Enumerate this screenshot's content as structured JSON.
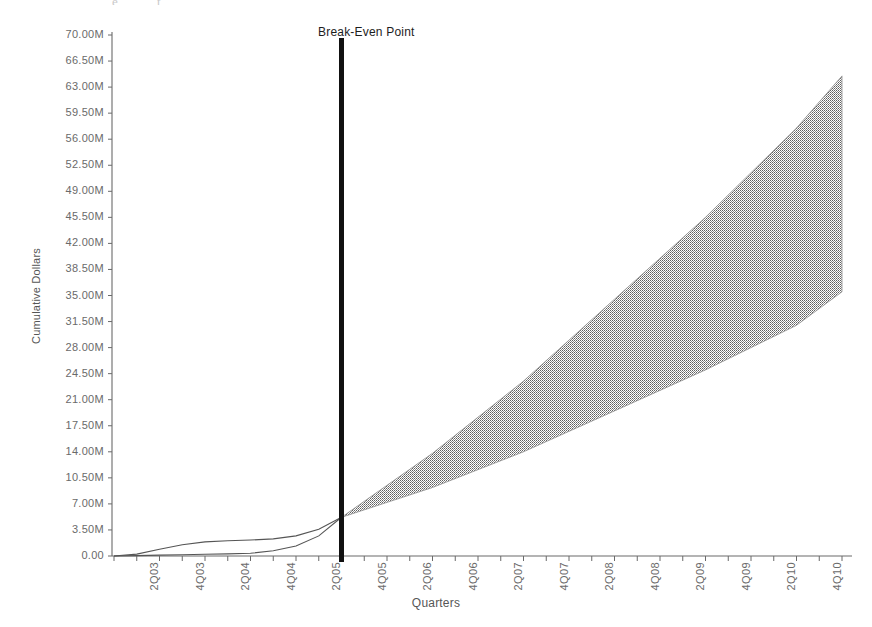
{
  "chart_data": {
    "type": "area",
    "title": "",
    "subtitle": "",
    "xlabel": "Quarters",
    "ylabel": "Cumulative Dollars",
    "grid": false,
    "legend_position": "none",
    "ylim": [
      0,
      70000000
    ],
    "y_ticks": [
      "0.00",
      "3.50M",
      "7.00M",
      "10.50M",
      "14.00M",
      "17.50M",
      "21.00M",
      "24.50M",
      "28.00M",
      "31.50M",
      "35.00M",
      "38.50M",
      "42.00M",
      "45.50M",
      "49.00M",
      "52.50M",
      "56.00M",
      "59.50M",
      "63.00M",
      "66.50M",
      "70.00M"
    ],
    "y_tick_values": [
      0,
      3500000,
      7000000,
      10500000,
      14000000,
      17500000,
      21000000,
      24500000,
      28000000,
      31500000,
      35000000,
      38500000,
      42000000,
      45500000,
      49000000,
      52500000,
      56000000,
      59500000,
      63000000,
      66500000,
      70000000
    ],
    "x_tick_labels": [
      "2Q03",
      "4Q03",
      "2Q04",
      "4Q04",
      "2Q05",
      "4Q05",
      "2Q06",
      "4Q06",
      "2Q07",
      "4Q07",
      "2Q08",
      "4Q08",
      "2Q09",
      "4Q09",
      "2Q10",
      "4Q10",
      "2Q11"
    ],
    "x_categories": [
      "2Q03",
      "3Q03",
      "4Q03",
      "1Q04",
      "2Q04",
      "3Q04",
      "4Q04",
      "1Q05",
      "2Q05",
      "3Q05",
      "4Q05",
      "1Q06",
      "2Q06",
      "3Q06",
      "4Q06",
      "1Q07",
      "2Q07",
      "3Q07",
      "4Q07",
      "1Q08",
      "2Q08",
      "3Q08",
      "4Q08",
      "1Q09",
      "2Q09",
      "3Q09",
      "4Q09",
      "1Q10",
      "2Q10",
      "3Q10",
      "4Q10",
      "1Q11",
      "2Q11"
    ],
    "annotations": [
      {
        "text": "Break-Even Point",
        "at_x": "4Q05",
        "type": "vertical-line",
        "color": "#111111"
      }
    ],
    "series": [
      {
        "name": "Historical Upper",
        "type": "line",
        "color": "#555555",
        "x": [
          "2Q03",
          "3Q03",
          "4Q03",
          "1Q04",
          "2Q04",
          "3Q04",
          "4Q04",
          "1Q05",
          "2Q05",
          "3Q05",
          "4Q05"
        ],
        "values": [
          0,
          250000,
          900000,
          1500000,
          1900000,
          2050000,
          2150000,
          2300000,
          2700000,
          3600000,
          5200000
        ]
      },
      {
        "name": "Historical Lower",
        "type": "line",
        "color": "#555555",
        "x": [
          "2Q03",
          "3Q03",
          "4Q03",
          "1Q04",
          "2Q04",
          "3Q04",
          "4Q04",
          "1Q05",
          "2Q05",
          "3Q05",
          "4Q05"
        ],
        "values": [
          0,
          60000,
          120000,
          180000,
          230000,
          280000,
          360000,
          700000,
          1350000,
          2700000,
          5200000
        ]
      },
      {
        "name": "Forecast Upper Bound",
        "type": "area-bound",
        "color": "#9a9a9a",
        "x": [
          "4Q05",
          "4Q06",
          "4Q07",
          "4Q08",
          "4Q09",
          "4Q10",
          "2Q11"
        ],
        "values": [
          5200000,
          13800000,
          23500000,
          34500000,
          45500000,
          57500000,
          64500000
        ]
      },
      {
        "name": "Forecast Lower Bound",
        "type": "area-bound",
        "color": "#9a9a9a",
        "x": [
          "4Q05",
          "4Q06",
          "4Q07",
          "4Q08",
          "4Q09",
          "4Q10",
          "2Q11"
        ],
        "values": [
          5200000,
          9200000,
          14000000,
          19500000,
          25000000,
          31000000,
          35500000
        ]
      }
    ],
    "fill_color": "#9b9b9b",
    "axis_color": "#6a6a6a"
  },
  "axes": {
    "y_title": "Cumulative Dollars",
    "x_title": "Quarters"
  },
  "annotation": {
    "break_even_label": "Break-Even Point"
  },
  "artifacts": {
    "top_left_smudge": "e",
    "top_mid_smudge": "t"
  }
}
